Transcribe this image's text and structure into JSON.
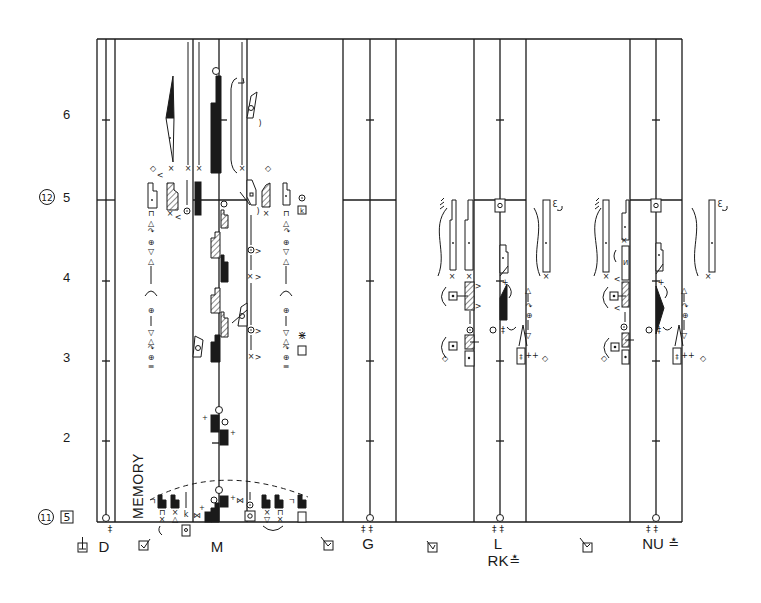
{
  "score": {
    "annotation": "MEMORY",
    "beat_numbers": {
      "b6": "6",
      "b5": "5",
      "b4": "4",
      "b3": "3",
      "b2": "2"
    },
    "measures": {
      "m12": "12",
      "m11": "11"
    },
    "boxed_count": "5",
    "staff_labels": {
      "d": "D",
      "m": "M",
      "g": "G",
      "l": "L",
      "rk": "RK",
      "rk_mark": "≛",
      "nu": "NU",
      "nu_mark": "≛"
    },
    "hold_marks": {
      "d": "‡",
      "g": "‡ ‡",
      "l": "‡ ‡",
      "nu": "‡ ‡"
    },
    "glyphs": {
      "cross": "×",
      "diamond": "◇",
      "caret_left": "<",
      "caret_right": ">",
      "hook_right": ")",
      "hook_left": "(",
      "box_top": "⊓",
      "up_arrow": "△",
      "down_arrow": "▽",
      "circle_plus": "⊕",
      "curl": "↷",
      "triple_bar": "≡",
      "bowtie": "⋈",
      "plus": "+",
      "double_plus": "++",
      "hold": "‡",
      "wave": "~",
      "hook_corner": "ㄱ",
      "k_mark": "k",
      "feather": "⋇",
      "n_mark": "И",
      "lambda": "Λ",
      "comb_left": "ﾐ",
      "comb_right": "Ɛ"
    }
  },
  "colors": {
    "ink": "#1a1a1a",
    "paper": "#ffffff"
  }
}
